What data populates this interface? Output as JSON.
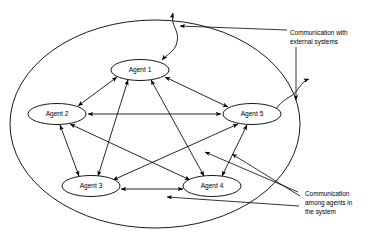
{
  "figure": {
    "type": "diagram",
    "boundary_name": "system-boundary"
  },
  "nodes": [
    {
      "id": "agent1",
      "label": "Agent 1",
      "cx": 140,
      "cy": 70,
      "rx": 29,
      "ry": 10.5
    },
    {
      "id": "agent2",
      "label": "Agent 2",
      "cx": 57,
      "cy": 114,
      "rx": 29,
      "ry": 10.5
    },
    {
      "id": "agent5",
      "label": "Agent 5",
      "cx": 252,
      "cy": 114,
      "rx": 29,
      "ry": 10.5
    },
    {
      "id": "agent3",
      "label": "Agent 3",
      "cx": 91,
      "cy": 186,
      "rx": 29,
      "ry": 10.5
    },
    {
      "id": "agent4",
      "label": "Agent 4",
      "cx": 212,
      "cy": 186,
      "rx": 29,
      "ry": 10.5
    }
  ],
  "edges": [
    {
      "from": "agent1",
      "to": "agent2",
      "direction": "both"
    },
    {
      "from": "agent1",
      "to": "agent5",
      "direction": "both"
    },
    {
      "from": "agent1",
      "to": "agent3",
      "direction": "both"
    },
    {
      "from": "agent1",
      "to": "agent4",
      "direction": "both"
    },
    {
      "from": "agent2",
      "to": "agent5",
      "direction": "both"
    },
    {
      "from": "agent2",
      "to": "agent3",
      "direction": "both"
    },
    {
      "from": "agent2",
      "to": "agent4",
      "direction": "both"
    },
    {
      "from": "agent5",
      "to": "agent3",
      "direction": "both"
    },
    {
      "from": "agent5",
      "to": "agent4",
      "direction": "both"
    },
    {
      "from": "agent3",
      "to": "agent4",
      "direction": "both"
    }
  ],
  "external_links": [
    {
      "id": "external-link-top",
      "at": "top",
      "direction": "both"
    },
    {
      "id": "external-link-right",
      "at": "right",
      "direction": "both"
    }
  ],
  "annotations": {
    "external": {
      "line1": "Communication with",
      "line2": "external systems"
    },
    "internal": {
      "line1": "Communication",
      "line2": "among agents in",
      "line3": "the system"
    }
  },
  "colors": {
    "stroke": "#000000",
    "background": "#ffffff",
    "node_fill": "#ffffff"
  }
}
